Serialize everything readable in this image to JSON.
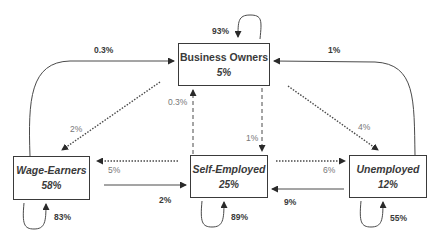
{
  "nodes": {
    "business_owners": {
      "name": "Business Owners",
      "pct": "5%",
      "self_loop": "93%"
    },
    "wage_earners": {
      "name": "Wage-Earners",
      "pct": "58%",
      "self_loop": "83%"
    },
    "self_employed": {
      "name": "Self-Employed",
      "pct": "25%",
      "self_loop": "89%"
    },
    "unemployed": {
      "name": "Unemployed",
      "pct": "12%",
      "self_loop": "55%"
    }
  },
  "edges": {
    "wage_to_business": "0.3%",
    "unemployed_to_business": "1%",
    "business_to_wage": "2%",
    "business_to_unemployed": "4%",
    "self_to_business": "0.3%",
    "business_to_self": "1%",
    "self_to_wage": "5%",
    "wage_to_self": "2%",
    "self_to_unemployed": "6%",
    "unemployed_to_self": "9%"
  },
  "colors": {
    "line": "#3a3a3a",
    "text": "#3a3a3a",
    "light_text": "#777777"
  }
}
